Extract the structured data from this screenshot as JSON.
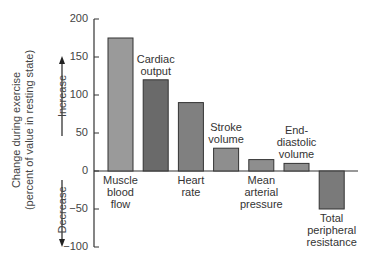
{
  "chart_data": {
    "type": "bar",
    "title": "",
    "xlabel": "",
    "ylabel": "Change during exercise (percent of value in resting state)",
    "ylabel_lines": [
      "Change during exercise",
      "(percent of value in resting state)"
    ],
    "ylim": [
      -100,
      200
    ],
    "yticks": [
      200,
      150,
      100,
      50,
      0,
      -50,
      -100
    ],
    "ytick_labels": [
      "200",
      "150",
      "100",
      "50",
      "0",
      "−50",
      "−100"
    ],
    "direction_labels": {
      "up": "Increase",
      "down": "Decrease"
    },
    "grid": false,
    "categories": [
      "Muscle blood flow",
      "Cardiac output",
      "Heart rate",
      "Stroke volume",
      "Mean arterial pressure",
      "End-diastolic volume",
      "Total peripheral resistance"
    ],
    "category_label_lines": [
      [
        "Muscle",
        "blood",
        "flow"
      ],
      [
        "Cardiac",
        "output"
      ],
      [
        "Heart",
        "rate"
      ],
      [
        "Stroke",
        "volume"
      ],
      [
        "Mean",
        "arterial",
        "pressure"
      ],
      [
        "End-",
        "diastolic",
        "volume"
      ],
      [
        "Total",
        "peripheral",
        "resistance"
      ]
    ],
    "values": [
      175,
      120,
      90,
      30,
      15,
      10,
      -50
    ],
    "colors": [
      "#9a9a9a",
      "#6a6a6a",
      "#808080",
      "#8e8e8e",
      "#8e8e8e",
      "#8e8e8e",
      "#7a7a7a"
    ]
  }
}
